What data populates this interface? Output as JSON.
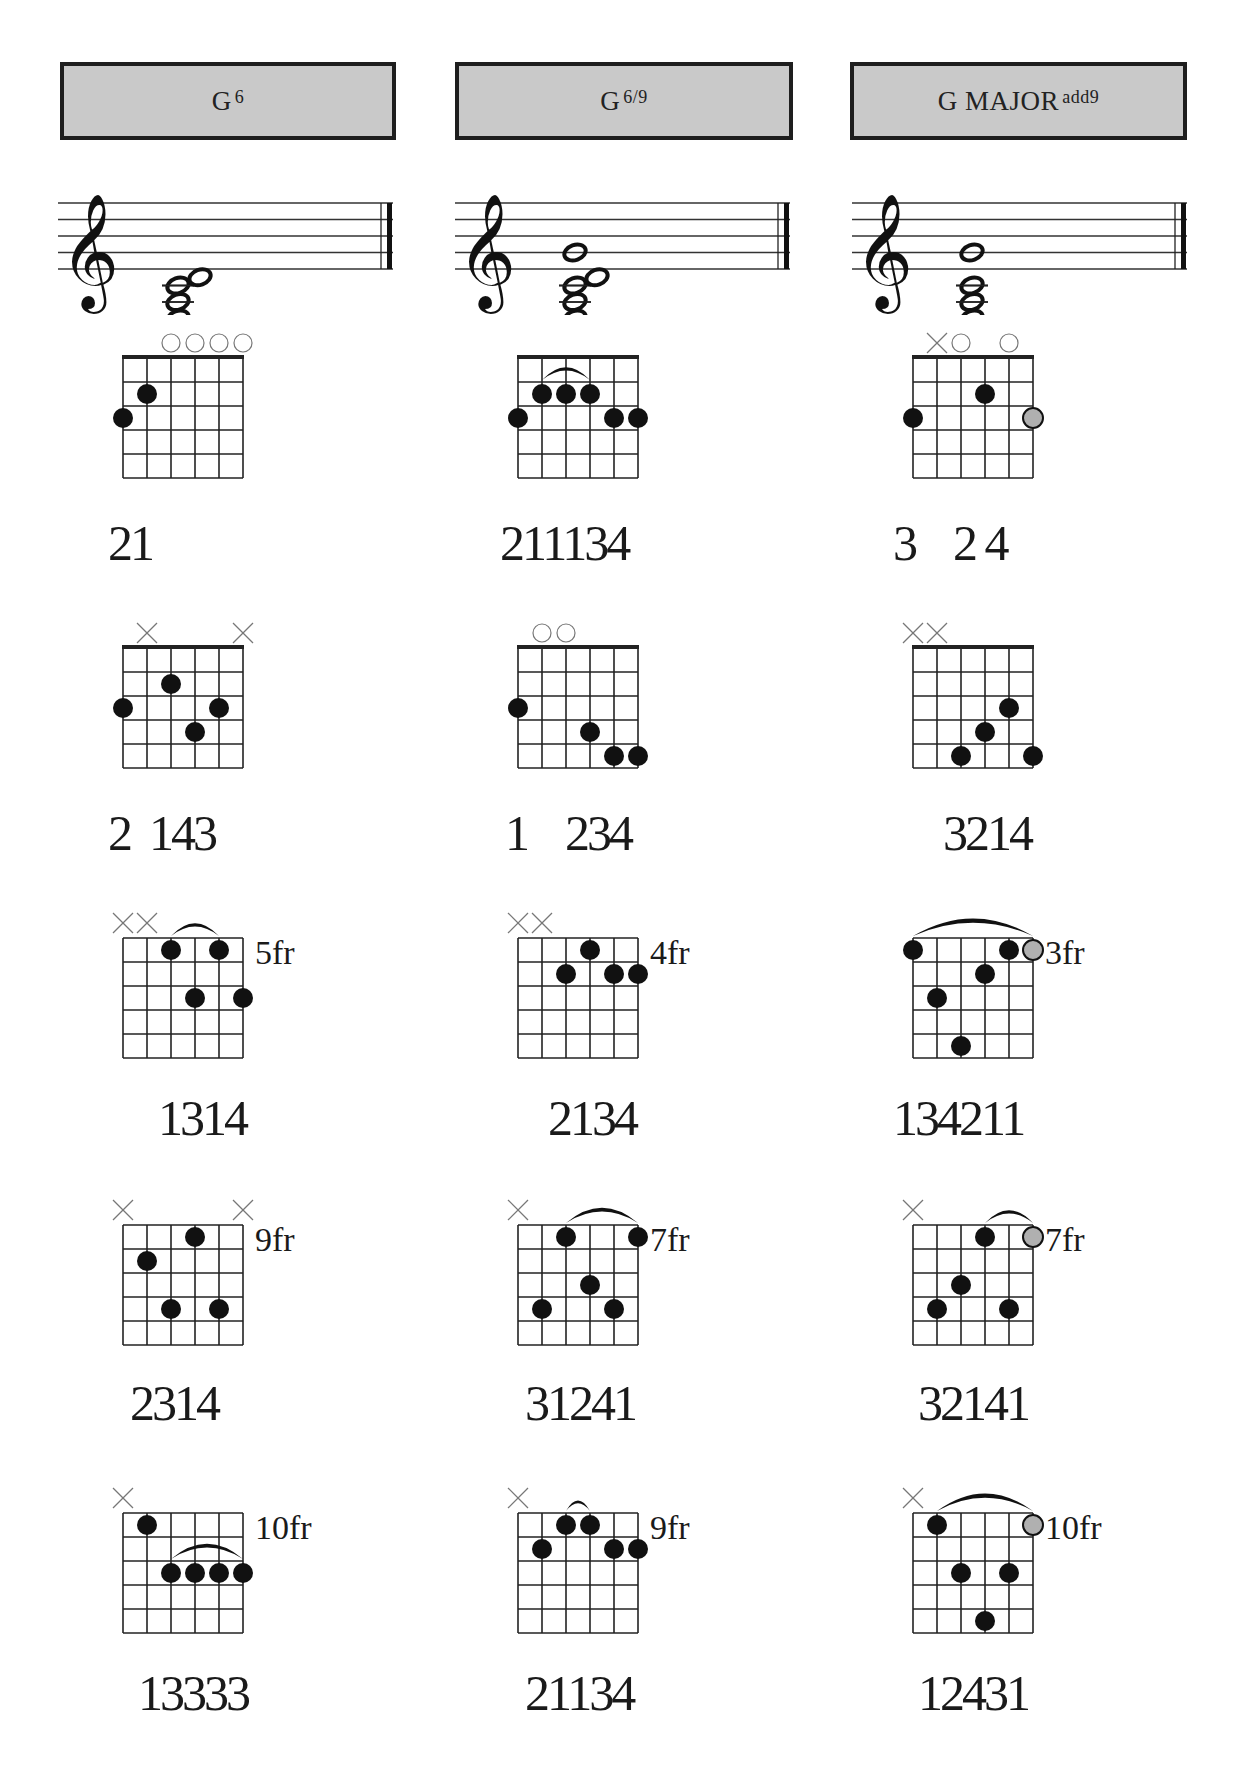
{
  "columns": [
    {
      "title_main": "G",
      "title_sup": "6",
      "left": 60,
      "width": 336,
      "staff": {
        "left": 58,
        "width": 340,
        "notes": [
          {
            "pos": -6,
            "x": 100
          },
          {
            "pos": -4,
            "x": 100
          },
          {
            "pos": -2,
            "x": 100
          },
          {
            "pos": -1,
            "x": 122
          }
        ]
      }
    },
    {
      "title_main": "G",
      "title_sup": "6/9",
      "left": 455,
      "width": 338,
      "staff": {
        "left": 455,
        "width": 340,
        "notes": [
          {
            "pos": -6,
            "x": 100
          },
          {
            "pos": -4,
            "x": 100
          },
          {
            "pos": -2,
            "x": 100
          },
          {
            "pos": -1,
            "x": 122
          },
          {
            "pos": 2,
            "x": 100
          }
        ]
      }
    },
    {
      "title_main": "G MAJOR",
      "title_sup": "add9",
      "left": 850,
      "width": 337,
      "staff": {
        "left": 852,
        "width": 340,
        "notes": [
          {
            "pos": -6,
            "x": 100
          },
          {
            "pos": -4,
            "x": 100
          },
          {
            "pos": -2,
            "x": 100
          },
          {
            "pos": 2,
            "x": 100
          }
        ]
      }
    }
  ],
  "diagrams": [
    [
      {
        "left": 123,
        "top": 358,
        "nut": true,
        "fret_label": "",
        "markers": [
          null,
          null,
          "o",
          "o",
          "o",
          "o"
        ],
        "dots": [
          {
            "s": 0,
            "f": 3
          },
          {
            "s": 1,
            "f": 2
          }
        ],
        "barres": [],
        "fingering": "21",
        "fing_left": 108,
        "fing_top": 518
      },
      {
        "left": 123,
        "top": 648,
        "nut": true,
        "fret_label": "",
        "markers": [
          null,
          "x",
          null,
          null,
          null,
          "x"
        ],
        "dots": [
          {
            "s": 0,
            "f": 3
          },
          {
            "s": 2,
            "f": 2
          },
          {
            "s": 3,
            "f": 4
          },
          {
            "s": 4,
            "f": 3
          }
        ],
        "barres": [],
        "fingering": "2  143",
        "fing_left": 108,
        "fing_top": 808
      },
      {
        "left": 123,
        "top": 938,
        "nut": false,
        "fret_label": "5fr",
        "markers": [
          "x",
          "x",
          null,
          null,
          null,
          null
        ],
        "dots": [
          {
            "s": 2,
            "f": 1
          },
          {
            "s": 4,
            "f": 1
          },
          {
            "s": 3,
            "f": 3
          },
          {
            "s": 5,
            "f": 3
          }
        ],
        "barres": [
          {
            "from": 2,
            "to": 4,
            "f": 1
          }
        ],
        "fingering": "1314",
        "fing_left": 158,
        "fing_top": 1093
      },
      {
        "left": 123,
        "top": 1225,
        "nut": false,
        "fret_label": "9fr",
        "markers": [
          "x",
          null,
          null,
          null,
          null,
          "x"
        ],
        "dots": [
          {
            "s": 3,
            "f": 1
          },
          {
            "s": 1,
            "f": 2
          },
          {
            "s": 2,
            "f": 4
          },
          {
            "s": 4,
            "f": 4
          }
        ],
        "barres": [],
        "fingering": "2314",
        "fing_left": 130,
        "fing_top": 1378
      },
      {
        "left": 123,
        "top": 1513,
        "nut": false,
        "fret_label": "10fr",
        "markers": [
          "x",
          null,
          null,
          null,
          null,
          null
        ],
        "dots": [
          {
            "s": 1,
            "f": 1
          },
          {
            "s": 2,
            "f": 3
          },
          {
            "s": 3,
            "f": 3
          },
          {
            "s": 4,
            "f": 3
          },
          {
            "s": 5,
            "f": 3
          }
        ],
        "barres": [
          {
            "from": 2,
            "to": 5,
            "f": 3
          }
        ],
        "fingering": "13333",
        "fing_left": 138,
        "fing_top": 1668
      }
    ],
    [
      {
        "left": 518,
        "top": 358,
        "nut": true,
        "fret_label": "",
        "markers": [
          null,
          null,
          null,
          null,
          null,
          null
        ],
        "dots": [
          {
            "s": 0,
            "f": 3
          },
          {
            "s": 1,
            "f": 2
          },
          {
            "s": 2,
            "f": 2
          },
          {
            "s": 3,
            "f": 2
          },
          {
            "s": 4,
            "f": 3
          },
          {
            "s": 5,
            "f": 3
          }
        ],
        "barres": [
          {
            "from": 1,
            "to": 3,
            "f": 2
          }
        ],
        "fingering": "211134",
        "fing_left": 500,
        "fing_top": 518
      },
      {
        "left": 518,
        "top": 648,
        "nut": true,
        "fret_label": "",
        "markers": [
          null,
          "o",
          "o",
          null,
          null,
          null
        ],
        "dots": [
          {
            "s": 0,
            "f": 3
          },
          {
            "s": 3,
            "f": 4
          },
          {
            "s": 4,
            "f": 5
          },
          {
            "s": 5,
            "f": 5
          }
        ],
        "barres": [],
        "fingering": "1    234",
        "fing_left": 505,
        "fing_top": 808
      },
      {
        "left": 518,
        "top": 938,
        "nut": false,
        "fret_label": "4fr",
        "markers": [
          "x",
          "x",
          null,
          null,
          null,
          null
        ],
        "dots": [
          {
            "s": 3,
            "f": 1
          },
          {
            "s": 2,
            "f": 2
          },
          {
            "s": 4,
            "f": 2
          },
          {
            "s": 5,
            "f": 2
          }
        ],
        "barres": [],
        "fingering": "2134",
        "fing_left": 548,
        "fing_top": 1093
      },
      {
        "left": 518,
        "top": 1225,
        "nut": false,
        "fret_label": "7fr",
        "markers": [
          "x",
          null,
          null,
          null,
          null,
          null
        ],
        "dots": [
          {
            "s": 2,
            "f": 1
          },
          {
            "s": 5,
            "f": 1
          },
          {
            "s": 3,
            "f": 3
          },
          {
            "s": 1,
            "f": 4
          },
          {
            "s": 4,
            "f": 4
          }
        ],
        "barres": [
          {
            "from": 2,
            "to": 5,
            "f": 1
          }
        ],
        "fingering": "31241",
        "fing_left": 525,
        "fing_top": 1378
      },
      {
        "left": 518,
        "top": 1513,
        "nut": false,
        "fret_label": "9fr",
        "markers": [
          "x",
          null,
          null,
          null,
          null,
          null
        ],
        "dots": [
          {
            "s": 2,
            "f": 1
          },
          {
            "s": 3,
            "f": 1
          },
          {
            "s": 1,
            "f": 2
          },
          {
            "s": 4,
            "f": 2
          },
          {
            "s": 5,
            "f": 2
          }
        ],
        "barres": [
          {
            "from": 2,
            "to": 3,
            "f": 1
          }
        ],
        "fingering": "21134",
        "fing_left": 525,
        "fing_top": 1668
      }
    ],
    [
      {
        "left": 913,
        "top": 358,
        "nut": true,
        "fret_label": "",
        "markers": [
          null,
          "x",
          "o",
          null,
          "o",
          null
        ],
        "dots": [
          {
            "s": 0,
            "f": 3
          },
          {
            "s": 3,
            "f": 2
          },
          {
            "s": 5,
            "f": 3,
            "gray": true
          }
        ],
        "barres": [],
        "fingering": "3    2 4",
        "fing_left": 893,
        "fing_top": 518
      },
      {
        "left": 913,
        "top": 648,
        "nut": true,
        "fret_label": "",
        "markers": [
          "x",
          "x",
          null,
          null,
          null,
          null
        ],
        "dots": [
          {
            "s": 4,
            "f": 3
          },
          {
            "s": 3,
            "f": 4
          },
          {
            "s": 2,
            "f": 5
          },
          {
            "s": 5,
            "f": 5
          }
        ],
        "barres": [],
        "fingering": "3214",
        "fing_left": 943,
        "fing_top": 808
      },
      {
        "left": 913,
        "top": 938,
        "nut": false,
        "fret_label": "3fr",
        "markers": [
          null,
          null,
          null,
          null,
          null,
          null
        ],
        "dots": [
          {
            "s": 0,
            "f": 1
          },
          {
            "s": 4,
            "f": 1
          },
          {
            "s": 5,
            "f": 1,
            "gray": true
          },
          {
            "s": 3,
            "f": 2
          },
          {
            "s": 1,
            "f": 3
          },
          {
            "s": 2,
            "f": 5
          }
        ],
        "barres": [
          {
            "from": 0,
            "to": 5,
            "f": 1
          }
        ],
        "fingering": "134211",
        "fing_left": 893,
        "fing_top": 1093
      },
      {
        "left": 913,
        "top": 1225,
        "nut": false,
        "fret_label": "7fr",
        "markers": [
          "x",
          null,
          null,
          null,
          null,
          null
        ],
        "dots": [
          {
            "s": 3,
            "f": 1
          },
          {
            "s": 5,
            "f": 1,
            "gray": true
          },
          {
            "s": 2,
            "f": 3
          },
          {
            "s": 1,
            "f": 4
          },
          {
            "s": 4,
            "f": 4
          }
        ],
        "barres": [
          {
            "from": 3,
            "to": 5,
            "f": 1
          }
        ],
        "fingering": "32141",
        "fing_left": 918,
        "fing_top": 1378
      },
      {
        "left": 913,
        "top": 1513,
        "nut": false,
        "fret_label": "10fr",
        "markers": [
          "x",
          null,
          null,
          null,
          null,
          null
        ],
        "dots": [
          {
            "s": 1,
            "f": 1
          },
          {
            "s": 5,
            "f": 1,
            "gray": true
          },
          {
            "s": 2,
            "f": 3
          },
          {
            "s": 4,
            "f": 3
          },
          {
            "s": 3,
            "f": 5
          }
        ],
        "barres": [
          {
            "from": 1,
            "to": 5,
            "f": 1
          }
        ],
        "fingering": "12431",
        "fing_left": 918,
        "fing_top": 1668
      }
    ]
  ],
  "colors": {
    "header_bg": "#c9c9c9",
    "header_border": "#1e1e1e",
    "dot": "#111111",
    "gray_dot": "#b0b0b0",
    "marker": "#777777",
    "grid": "#222222"
  }
}
